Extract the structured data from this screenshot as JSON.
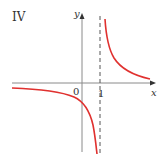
{
  "figure": {
    "panel_label": "IV",
    "axes": {
      "x_label": "x",
      "y_label": "y",
      "origin_label": "0",
      "tick_labels": [
        "1"
      ]
    },
    "asymptote": {
      "type": "vertical",
      "x": 1,
      "style": "dashed"
    },
    "curve": {
      "description": "hyperbola with vertical asymptote at x = 1 and horizontal asymptote y = 0",
      "branches": [
        "right branch above x-axis (x > 1)",
        "left branch below x-axis (x < 1)"
      ]
    },
    "colors": {
      "curve": "#e0312f",
      "axes": "#8a8a8a",
      "asymptote": "#555555",
      "text": "#333333"
    }
  }
}
